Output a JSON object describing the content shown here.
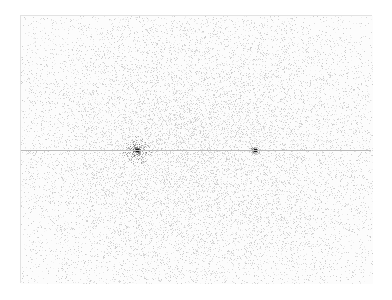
{
  "image": {
    "description": "Grayscale noise texture (dense speckle) inside a thin-bordered frame, with a faint horizontal line across the middle and two dark point sources",
    "frame": {
      "x": 20,
      "y": 15,
      "width": 352,
      "height": 268,
      "border_color": "#e2e2e2"
    },
    "horizontal_line": {
      "y": 149,
      "color": "#b9b9b9"
    },
    "bright_spots": [
      {
        "x": 136,
        "y": 149,
        "strength": 1.0,
        "halo": 14
      },
      {
        "x": 254,
        "y": 149,
        "strength": 0.6,
        "halo": 5
      }
    ],
    "density_center": {
      "x": 200,
      "y": 150
    },
    "colors": {
      "background": "#ffffff",
      "speckle": "#555555"
    }
  }
}
